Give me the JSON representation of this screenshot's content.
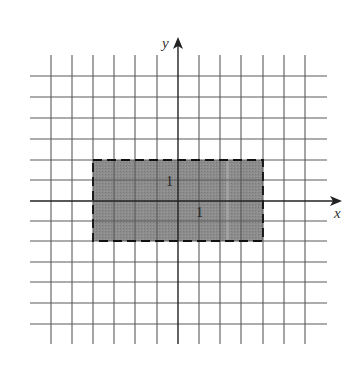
{
  "diagram": {
    "type": "coordinate-grid",
    "axes": {
      "x_label": "x",
      "y_label": "y"
    },
    "grid": {
      "x_min": -6,
      "x_max": 6,
      "y_min": -6,
      "y_max": 6,
      "step": 1
    },
    "region": {
      "shape": "rectangle",
      "x_range": [
        -4,
        4
      ],
      "y_range": [
        -2,
        2
      ],
      "border": "dashed",
      "fill": "#8a8a8a"
    },
    "annotations": [
      {
        "text": "1",
        "position": "left of y-axis, between y=0 and y=1"
      },
      {
        "text": "1",
        "position": "right of y-axis, below x-axis"
      }
    ]
  },
  "labels": {
    "x_axis": "x",
    "y_axis": "y",
    "unit_vertical": "1",
    "unit_horizontal": "1"
  },
  "colors": {
    "grid": "#555555",
    "axis": "#222222",
    "region_fill": "#8a8a8a",
    "region_border": "#111111"
  }
}
